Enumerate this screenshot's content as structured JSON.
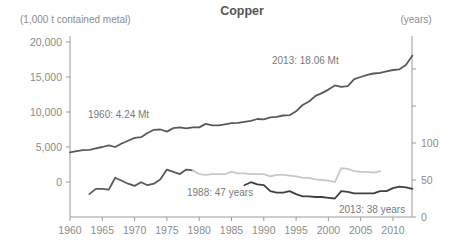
{
  "chart_data": {
    "type": "line",
    "title": "Copper",
    "xlabel": "",
    "ylabel_left": "(1,000 t contained metal)",
    "ylabel_right": "(years)",
    "xlim": [
      1960,
      2013
    ],
    "ylim_left": [
      -5000,
      20000
    ],
    "ylim_right": [
      0,
      200
    ],
    "x_ticks": [
      "1960",
      "1965",
      "1970",
      "1975",
      "1980",
      "1985",
      "1990",
      "1995",
      "2000",
      "2005",
      "2010"
    ],
    "y_ticks_left": [
      "20,000",
      "15,000",
      "10,000",
      "5,000",
      "0"
    ],
    "y_ticks_right": [
      "100",
      "50",
      "0"
    ],
    "grid": false,
    "legend": null,
    "annotations": [
      "1960: 4.24 Mt",
      "2013: 18.06 Mt",
      "1988: 47 years",
      "2013: 38 years"
    ],
    "series": [
      {
        "name": "Mine production (1,000 t contained metal)",
        "axis": "left",
        "color": "#595959",
        "x": [
          1960,
          1961,
          1962,
          1963,
          1964,
          1965,
          1966,
          1967,
          1968,
          1969,
          1970,
          1971,
          1972,
          1973,
          1974,
          1975,
          1976,
          1977,
          1978,
          1979,
          1980,
          1981,
          1982,
          1983,
          1984,
          1985,
          1986,
          1987,
          1988,
          1989,
          1990,
          1991,
          1992,
          1993,
          1994,
          1995,
          1996,
          1997,
          1998,
          1999,
          2000,
          2001,
          2002,
          2003,
          2004,
          2005,
          2006,
          2007,
          2008,
          2009,
          2010,
          2011,
          2012,
          2013
        ],
        "values": [
          4240,
          4400,
          4550,
          4600,
          4800,
          5000,
          5250,
          5000,
          5500,
          5900,
          6300,
          6400,
          7000,
          7450,
          7500,
          7200,
          7700,
          7800,
          7650,
          7800,
          7800,
          8300,
          8100,
          8100,
          8250,
          8400,
          8450,
          8600,
          8750,
          9000,
          8950,
          9250,
          9300,
          9500,
          9550,
          10100,
          11000,
          11500,
          12300,
          12700,
          13200,
          13800,
          13600,
          13700,
          14700,
          15000,
          15300,
          15500,
          15600,
          15800,
          16000,
          16100,
          16700,
          18060
        ]
      },
      {
        "name": "Reserve life, early series (years)",
        "axis": "right",
        "color": "#595959",
        "x": [
          1963,
          1964,
          1965,
          1966,
          1967,
          1968,
          1969,
          1970,
          1971,
          1972,
          1973,
          1974,
          1975,
          1976,
          1977,
          1978,
          1979
        ],
        "values": [
          31,
          38,
          38,
          37,
          53,
          49,
          45,
          42,
          47,
          43,
          45,
          51,
          64,
          61,
          58,
          64,
          63
        ]
      },
      {
        "name": "Reserve life, alternate series (years)",
        "axis": "right",
        "color": "#c8c8c8",
        "x": [
          1979,
          1980,
          1981,
          1982,
          1983,
          1984,
          1985,
          1986,
          1987,
          1988,
          1989,
          1990,
          1991,
          1992,
          1993,
          1994,
          1995,
          1996,
          1997,
          1998,
          1999,
          2000,
          2001,
          2002,
          2003,
          2004,
          2005,
          2006,
          2007,
          2008
        ],
        "values": [
          63,
          58,
          57,
          58,
          58,
          58,
          61,
          59,
          59,
          58,
          58,
          58,
          55,
          57,
          57,
          56,
          55,
          53,
          53,
          51,
          50,
          49,
          47,
          66,
          65,
          62,
          61,
          61,
          60,
          62
        ]
      },
      {
        "name": "Reserve life (years)",
        "axis": "right",
        "color": "#404040",
        "x": [
          1987,
          1988,
          1989,
          1990,
          1991,
          1992,
          1993,
          1994,
          1995,
          1996,
          1997,
          1998,
          1999,
          2000,
          2001,
          2002,
          2003,
          2004,
          2005,
          2006,
          2007,
          2008,
          2009,
          2010,
          2011,
          2012,
          2013
        ],
        "values": [
          43,
          47,
          44,
          43,
          35,
          33,
          33,
          35,
          31,
          28,
          28,
          27,
          27,
          26,
          25,
          35,
          34,
          32,
          32,
          32,
          32,
          35,
          35,
          39,
          41,
          40,
          38
        ]
      }
    ]
  },
  "labels": {
    "title": "Copper",
    "left_unit": "(1,000 t contained metal)",
    "right_unit": "(years)",
    "annot_1960": "1960: 4.24 Mt",
    "annot_2013_mt": "2013: 18.06 Mt",
    "annot_1988": "1988: 47 years",
    "annot_2013_years": "2013: 38 years"
  }
}
